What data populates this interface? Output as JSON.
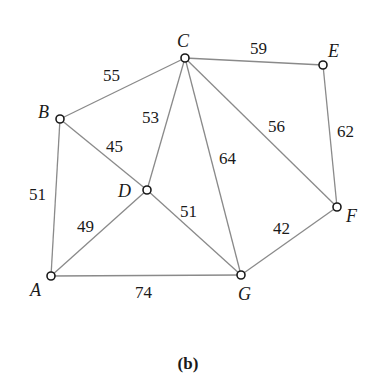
{
  "caption": "(b)",
  "nodes": [
    {
      "id": "A",
      "label": "A",
      "x": 51,
      "y": 276,
      "lx": 30,
      "ly": 296
    },
    {
      "id": "B",
      "label": "B",
      "x": 60,
      "y": 119,
      "lx": 38,
      "ly": 118
    },
    {
      "id": "C",
      "label": "C",
      "x": 185,
      "y": 58,
      "lx": 177,
      "ly": 47
    },
    {
      "id": "D",
      "label": "D",
      "x": 147,
      "y": 190,
      "lx": 118,
      "ly": 197
    },
    {
      "id": "E",
      "label": "E",
      "x": 323,
      "y": 65,
      "lx": 328,
      "ly": 57
    },
    {
      "id": "F",
      "label": "F",
      "x": 337,
      "y": 207,
      "lx": 346,
      "ly": 222
    },
    {
      "id": "G",
      "label": "G",
      "x": 241,
      "y": 275,
      "lx": 238,
      "ly": 300
    }
  ],
  "edges": [
    {
      "from": "A",
      "to": "B",
      "weight": "51",
      "lx": 29,
      "ly": 200
    },
    {
      "from": "B",
      "to": "C",
      "weight": "55",
      "lx": 103,
      "ly": 81
    },
    {
      "from": "B",
      "to": "D",
      "weight": "45",
      "lx": 106,
      "ly": 152
    },
    {
      "from": "C",
      "to": "D",
      "weight": "53",
      "lx": 142,
      "ly": 123
    },
    {
      "from": "C",
      "to": "E",
      "weight": "59",
      "lx": 250,
      "ly": 54
    },
    {
      "from": "C",
      "to": "G",
      "weight": "64",
      "lx": 219,
      "ly": 164
    },
    {
      "from": "C",
      "to": "F",
      "weight": "56",
      "lx": 268,
      "ly": 132
    },
    {
      "from": "E",
      "to": "F",
      "weight": "62",
      "lx": 337,
      "ly": 137
    },
    {
      "from": "A",
      "to": "D",
      "weight": "49",
      "lx": 77,
      "ly": 232
    },
    {
      "from": "D",
      "to": "G",
      "weight": "51",
      "lx": 180,
      "ly": 217
    },
    {
      "from": "A",
      "to": "G",
      "weight": "74",
      "lx": 135,
      "ly": 298
    },
    {
      "from": "G",
      "to": "F",
      "weight": "42",
      "lx": 273,
      "ly": 234
    }
  ]
}
